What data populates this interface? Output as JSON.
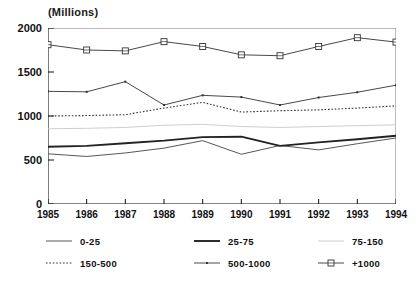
{
  "chart_data": {
    "type": "line",
    "title": "(Millions)",
    "xlabel": "",
    "ylabel": "",
    "ylim": [
      0,
      2000
    ],
    "yticks": [
      0,
      500,
      1000,
      1500,
      2000
    ],
    "grid": false,
    "legend_position": "bottom",
    "categories": [
      "1985",
      "1986",
      "1987",
      "1988",
      "1989",
      "1990",
      "1991",
      "1992",
      "1993",
      "1994"
    ],
    "x": [
      1985,
      1986,
      1987,
      1988,
      1989,
      1990,
      1991,
      1992,
      1993,
      1994
    ],
    "series": [
      {
        "name": "0-25",
        "style": "thin-solid",
        "color": "#444444",
        "marker": "none",
        "values": [
          570,
          540,
          580,
          635,
          720,
          565,
          665,
          615,
          685,
          750
        ]
      },
      {
        "name": "25-75",
        "style": "thick-solid",
        "color": "#222222",
        "marker": "none",
        "values": [
          650,
          660,
          690,
          720,
          760,
          765,
          660,
          700,
          735,
          775
        ]
      },
      {
        "name": "75-150",
        "style": "light-solid",
        "color": "#c8c8c8",
        "marker": "none",
        "values": [
          855,
          860,
          870,
          895,
          905,
          880,
          870,
          880,
          890,
          900
        ]
      },
      {
        "name": "150-500",
        "style": "dotted",
        "color": "#333333",
        "marker": "none",
        "values": [
          1000,
          1005,
          1015,
          1090,
          1155,
          1045,
          1060,
          1070,
          1090,
          1115
        ]
      },
      {
        "name": "500-1000",
        "style": "solid-dot",
        "color": "#333333",
        "marker": "dot",
        "values": [
          1280,
          1275,
          1390,
          1125,
          1235,
          1215,
          1125,
          1210,
          1270,
          1350
        ]
      },
      {
        "name": "+1000",
        "style": "solid-square",
        "color": "#333333",
        "marker": "square",
        "values": [
          1810,
          1750,
          1740,
          1845,
          1790,
          1695,
          1685,
          1790,
          1890,
          1840
        ]
      }
    ]
  },
  "legend": {
    "items": [
      {
        "label": "0-25"
      },
      {
        "label": "25-75"
      },
      {
        "label": "75-150"
      },
      {
        "label": "150-500"
      },
      {
        "label": "500-1000"
      },
      {
        "label": "+1000"
      }
    ]
  }
}
